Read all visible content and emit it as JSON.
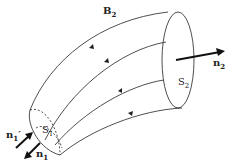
{
  "diagram": {
    "labels": {
      "field": {
        "main": "B",
        "sub": "2"
      },
      "surface_2": {
        "main": "S",
        "sub": "2"
      },
      "surface_1": {
        "main": "S",
        "sub": "1"
      },
      "normal_2": {
        "main": "n",
        "sub": "2"
      },
      "normal_1": {
        "main": "n",
        "sub": "1"
      },
      "normal_1_prime": {
        "main": "n",
        "sub": "1",
        "prime": "′"
      }
    },
    "colors": {
      "line": "#222222",
      "background": "#ffffff"
    }
  }
}
